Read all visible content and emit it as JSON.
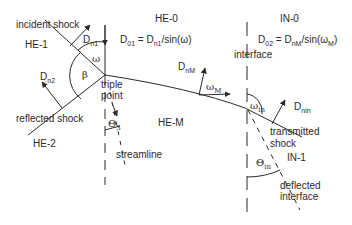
{
  "diagram": {
    "type": "shock refraction at interface (triple point)",
    "regions": {
      "he0": "HE-0",
      "he1": "HE-1",
      "he2": "HE-2",
      "hem": "HE-M",
      "in0": "IN-0",
      "in1": "IN-1"
    },
    "labels": {
      "incident_shock": "incident shock",
      "reflected_shock": "reflected shock",
      "triple": "triple",
      "point": "point",
      "streamline": "streamline",
      "interface": "interface",
      "transmitted": "transmitted",
      "shock": "shock",
      "deflected": "deflected",
      "interface2": "interface"
    },
    "equations": {
      "d01_lhs": "D",
      "d01_lhs_sub": "01",
      "d01_mid": " = D",
      "d01_mid_sub": "n1",
      "d01_rhs": "/sin(ω)",
      "d02_lhs": "D",
      "d02_lhs_sub": "02",
      "d02_mid": " = D",
      "d02_mid_sub": "nM",
      "d02_rhs1": "/sin(ω",
      "d02_rhs_sub": "M",
      "d02_rhs2": ")"
    },
    "vectors": {
      "dn1": {
        "base": "D",
        "sub": "n1"
      },
      "dn2": {
        "base": "D",
        "sub": "n2"
      },
      "dnm": {
        "base": "D",
        "sub": "nM"
      },
      "dnin": {
        "base": "D",
        "sub": "nin"
      }
    },
    "angles": {
      "omega": "ω",
      "beta": "β",
      "omega_m_base": "ω",
      "omega_m_sub": "M",
      "omega_in_base": "ω",
      "omega_in_sub": "in",
      "theta3_base": "Θ",
      "theta3_sub": "3",
      "theta_in_base": "Θ",
      "theta_in_sub": "in"
    },
    "colors": {
      "line": "#2a2a2a",
      "background": "#ffffff"
    }
  }
}
